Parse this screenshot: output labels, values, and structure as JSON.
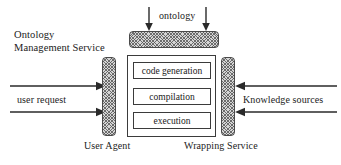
{
  "diagram": {
    "type": "architecture-block-diagram",
    "background_color": "#ffffff",
    "line_color": "#2a2a2a",
    "hatch_fill_color": "#d6d6d6",
    "components": {
      "ontology_management_service": {
        "label": "Ontology Management Service",
        "bar_style": "hatched-rounded-bar"
      },
      "user_agent": {
        "label": "User Agent",
        "bar_style": "hatched-rounded-bar"
      },
      "wrapping_service": {
        "label": "Wrapping Service",
        "bar_style": "hatched-rounded-bar"
      },
      "process_pipeline": {
        "steps": [
          {
            "label": "code generation"
          },
          {
            "label": "compilation"
          },
          {
            "label": "execution"
          }
        ]
      }
    },
    "flows": {
      "ontology": {
        "label": "ontology",
        "direction": "down",
        "arrow_count": 2
      },
      "user_request": {
        "label": "user request",
        "direction": "right",
        "arrow_count": 2
      },
      "knowledge_sources": {
        "label": "Knowledge sources",
        "direction": "left",
        "arrow_count": 2
      }
    }
  }
}
